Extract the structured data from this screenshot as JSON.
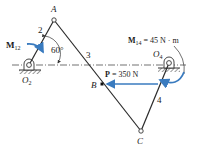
{
  "diagram": {
    "type": "four-bar-linkage",
    "colors": {
      "link": "#2a2a2a",
      "arrow": "#3a7bbf",
      "ground": "#555555",
      "centerline": "#333333"
    },
    "points": {
      "A": {
        "label": "A"
      },
      "B": {
        "label": "B"
      },
      "C": {
        "label": "C"
      },
      "O2": {
        "label": "O",
        "sub": "2"
      },
      "O4": {
        "label": "O",
        "sub": "4"
      }
    },
    "links": {
      "link2": "2",
      "link3": "3",
      "link4": "4"
    },
    "angle": {
      "value": "60°"
    },
    "moments": {
      "m12": {
        "symbol": "M",
        "sub": "12"
      },
      "m14": {
        "symbol": "M",
        "sub": "14",
        "value": " = 45 N · m"
      }
    },
    "force": {
      "symbol": "P",
      "value": " = 350 N"
    }
  }
}
